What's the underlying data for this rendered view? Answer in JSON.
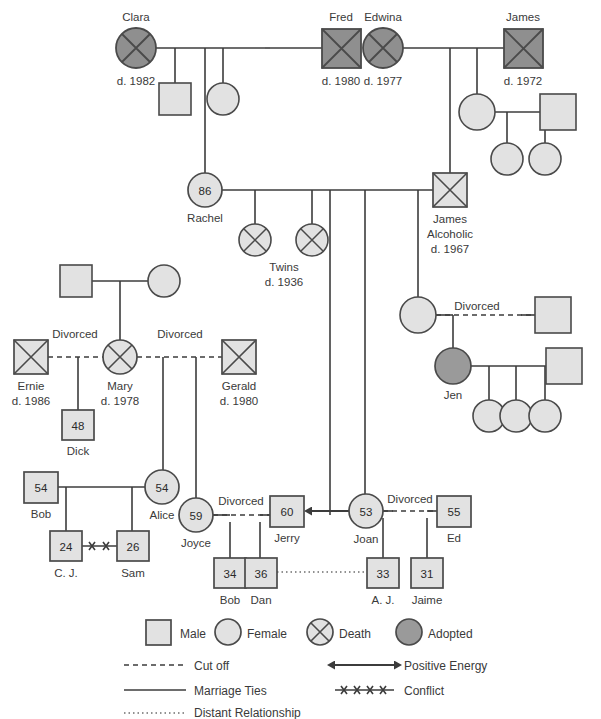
{
  "diagram": {
    "colors": {
      "shape_fill_light": "#e2e2e2",
      "shape_fill_dark": "#8f8f8f",
      "shape_fill_adopted": "#9a9a9a",
      "stroke": "#4a4a4a",
      "line": "#3c3c3c",
      "text": "#3a3a3a"
    },
    "generation1": {
      "clara": {
        "name": "Clara",
        "death": "d. 1982",
        "type": "female-death"
      },
      "fred": {
        "name": "Fred",
        "death": "d. 1980",
        "type": "male-death"
      },
      "edwina": {
        "name": "Edwina",
        "death": "d. 1977",
        "type": "female-death"
      },
      "james_sr": {
        "name": "James",
        "death": "d. 1972",
        "type": "male-death"
      }
    },
    "generation2": {
      "clara_son": {
        "name": "",
        "type": "male"
      },
      "clara_daughter": {
        "name": "",
        "type": "female"
      },
      "rachel": {
        "name": "Rachel",
        "age": "86",
        "type": "female"
      },
      "james_alcoholic": {
        "name": "James",
        "note": "Alcoholic",
        "death": "d. 1967",
        "type": "male-death"
      },
      "edwina_daughter": {
        "name": "",
        "type": "female"
      },
      "edwina_daughter_spouse": {
        "name": "",
        "type": "male"
      },
      "edwina_gd1": {
        "name": "",
        "type": "female"
      },
      "edwina_gd2": {
        "name": "",
        "type": "female"
      }
    },
    "twins": {
      "label": "Twins",
      "death": "d. 1936",
      "type": "female-death",
      "count": 2
    },
    "mary_family": {
      "grandfather": {
        "name": "",
        "type": "male"
      },
      "grandmother": {
        "name": "",
        "type": "female"
      },
      "ernie": {
        "name": "Ernie",
        "death": "d. 1986",
        "type": "male-death"
      },
      "mary": {
        "name": "Mary",
        "death": "d. 1978",
        "type": "female-death"
      },
      "gerald": {
        "name": "Gerald",
        "death": "d. 1980",
        "type": "male-death"
      },
      "dick": {
        "name": "Dick",
        "age": "48",
        "type": "male"
      }
    },
    "alice_family": {
      "bob_sr": {
        "name": "Bob",
        "age": "54",
        "type": "male"
      },
      "alice": {
        "name": "Alice",
        "age": "54",
        "type": "female"
      },
      "cj": {
        "name": "C. J.",
        "age": "24",
        "type": "male"
      },
      "sam": {
        "name": "Sam",
        "age": "26",
        "type": "male"
      }
    },
    "joyce_family": {
      "joyce": {
        "name": "Joyce",
        "age": "59",
        "type": "female"
      },
      "jerry": {
        "name": "Jerry",
        "age": "60",
        "type": "male"
      },
      "bob_jr": {
        "name": "Bob",
        "age": "34",
        "type": "male"
      },
      "dan": {
        "name": "Dan",
        "age": "36",
        "type": "male"
      }
    },
    "joan_family": {
      "joan": {
        "name": "Joan",
        "age": "53",
        "type": "female"
      },
      "ed": {
        "name": "Ed",
        "age": "55",
        "type": "male"
      },
      "aj": {
        "name": "A. J.",
        "age": "33",
        "type": "male"
      },
      "jaime": {
        "name": "Jaime",
        "age": "31",
        "type": "male"
      }
    },
    "jen_family": {
      "jen_mother": {
        "name": "",
        "type": "female"
      },
      "jen_mother_ex": {
        "name": "",
        "type": "male"
      },
      "jen": {
        "name": "Jen",
        "type": "female-adopted"
      },
      "jen_spouse": {
        "name": "",
        "type": "male"
      },
      "jen_child1": {
        "name": "",
        "type": "female"
      },
      "jen_child2": {
        "name": "",
        "type": "female"
      },
      "jen_child3": {
        "name": "",
        "type": "female"
      }
    },
    "relationship_labels": {
      "divorced_mary_ernie": "Divorced",
      "divorced_mary_gerald": "Divorced",
      "divorced_joyce_jerry": "Divorced",
      "divorced_joan_ed": "Divorced",
      "divorced_jen_parents": "Divorced"
    }
  },
  "legend": {
    "symbols": [
      {
        "id": "male",
        "label": "Male",
        "shape": "square",
        "fill": "light"
      },
      {
        "id": "female",
        "label": "Female",
        "shape": "circle",
        "fill": "light"
      },
      {
        "id": "death",
        "label": "Death",
        "shape": "circle-x",
        "fill": "light"
      },
      {
        "id": "adopted",
        "label": "Adopted",
        "shape": "circle",
        "fill": "dark"
      }
    ],
    "lines_left": [
      {
        "id": "cut-off",
        "label": "Cut off",
        "style": "dashed"
      },
      {
        "id": "marriage-ties",
        "label": "Marriage Ties",
        "style": "solid"
      },
      {
        "id": "distant-relationship",
        "label": "Distant Relationship",
        "style": "dotted"
      }
    ],
    "lines_right": [
      {
        "id": "positive-energy",
        "label": "Positive Energy",
        "style": "double-arrow"
      },
      {
        "id": "conflict",
        "label": "Conflict",
        "style": "hatched"
      }
    ]
  }
}
